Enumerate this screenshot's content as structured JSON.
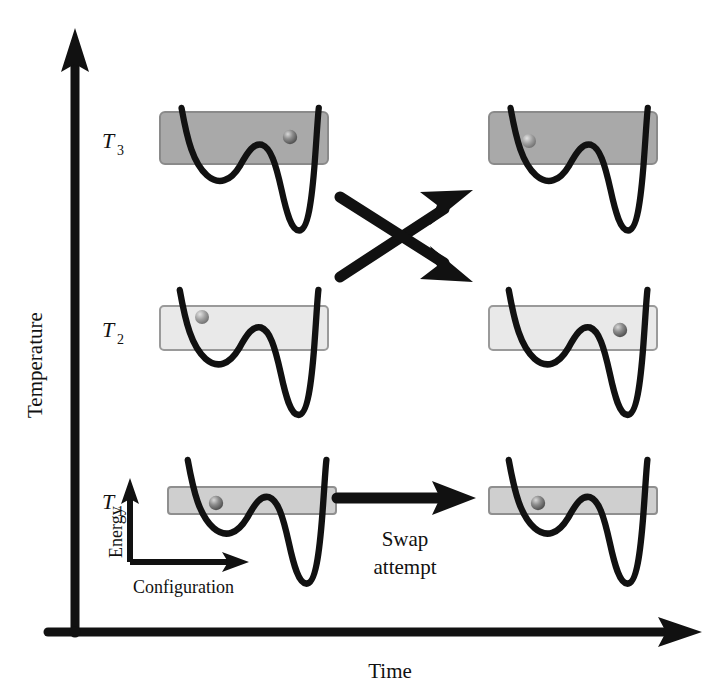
{
  "figure": {
    "background_color": "#ffffff",
    "ink_color": "#111111",
    "width": 715,
    "height": 692
  },
  "axes": {
    "y_axis": {
      "label": "Temperature",
      "name": "temperature-axis",
      "orientation": "vertical",
      "arrow_head": "up",
      "x": 75,
      "y_top": 34,
      "y_bottom": 632
    },
    "x_axis": {
      "label": "Time",
      "name": "time-axis",
      "orientation": "horizontal",
      "arrow_head": "right",
      "y": 632,
      "x_left": 48,
      "x_right": 700
    },
    "origin": {
      "x": 75,
      "y": 632
    }
  },
  "temperature_ticks": [
    {
      "symbol": "T",
      "subscript": "3",
      "label": "T3",
      "y": 141,
      "band_fill": "#a9a9a9",
      "band_stroke": "#8a8a8a",
      "band_height": 52
    },
    {
      "symbol": "T",
      "subscript": "2",
      "label": "T2",
      "y": 330,
      "band_fill": "#e9e9e9",
      "band_stroke": "#9a9a9a",
      "band_height": 44
    },
    {
      "symbol": "T",
      "subscript": "1",
      "label": "T1",
      "y": 502,
      "band_fill": "#cfcfcf",
      "band_stroke": "#8f8f8f",
      "band_height": 27
    }
  ],
  "inset_axes": {
    "x_label": "Configuration",
    "y_label": "Energy",
    "origin": {
      "x": 130,
      "y": 562
    },
    "y_top": 480,
    "x_right": 248
  },
  "panels": [
    {
      "name": "panel-t3-before",
      "temperature": "T3",
      "column": "before",
      "band": {
        "x": 160,
        "y": 112,
        "width": 168,
        "height": 52,
        "fill": "#a9a9a9",
        "stroke": "#8a8a8a"
      },
      "ball": {
        "x": 290,
        "y": 137,
        "state": "right-well",
        "fill": "#6e6e6e"
      },
      "landscape": "double-well"
    },
    {
      "name": "panel-t3-after",
      "temperature": "T3",
      "column": "after",
      "band": {
        "x": 489,
        "y": 112,
        "width": 168,
        "height": 52,
        "fill": "#a9a9a9",
        "stroke": "#8a8a8a"
      },
      "ball": {
        "x": 529,
        "y": 141,
        "state": "left-well",
        "fill": "#8e8e8e"
      },
      "landscape": "double-well"
    },
    {
      "name": "panel-t2-before",
      "temperature": "T2",
      "column": "before",
      "band": {
        "x": 160,
        "y": 306,
        "width": 168,
        "height": 44,
        "fill": "#e9e9e9",
        "stroke": "#9a9a9a"
      },
      "ball": {
        "x": 202,
        "y": 317,
        "state": "left-well",
        "fill": "#8e8e8e"
      },
      "landscape": "double-well"
    },
    {
      "name": "panel-t2-after",
      "temperature": "T2",
      "column": "after",
      "band": {
        "x": 489,
        "y": 306,
        "width": 168,
        "height": 44,
        "fill": "#e9e9e9",
        "stroke": "#9a9a9a"
      },
      "ball": {
        "x": 620,
        "y": 330,
        "state": "right-well",
        "fill": "#6e6e6e"
      },
      "landscape": "double-well"
    },
    {
      "name": "panel-t1-before",
      "temperature": "T1",
      "column": "before",
      "band": {
        "x": 168,
        "y": 487,
        "width": 168,
        "height": 27,
        "fill": "#cfcfcf",
        "stroke": "#8f8f8f"
      },
      "ball": {
        "x": 216,
        "y": 503,
        "state": "left-well",
        "fill": "#6e6e6e"
      },
      "landscape": "double-well"
    },
    {
      "name": "panel-t1-after",
      "temperature": "T1",
      "column": "after",
      "band": {
        "x": 489,
        "y": 487,
        "width": 168,
        "height": 27,
        "fill": "#cfcfcf",
        "stroke": "#8f8f8f"
      },
      "ball": {
        "x": 538,
        "y": 503,
        "state": "left-well",
        "fill": "#6e6e6e"
      },
      "landscape": "double-well"
    }
  ],
  "arrows": {
    "swap_cross": {
      "name": "swap-cross-arrows",
      "description": "Two crossing arrows indicating an accepted replica exchange between T2 and T3",
      "up_arrow": {
        "from_x": 338,
        "from_y": 275,
        "to_x": 468,
        "to_y": 190
      },
      "down_arrow": {
        "from_x": 338,
        "from_y": 196,
        "to_x": 468,
        "to_y": 278
      }
    },
    "swap_attempt": {
      "name": "swap-attempt-arrow",
      "label_line1": "Swap",
      "label_line2": "attempt",
      "from_x": 336,
      "to_x": 474,
      "y": 498,
      "label_x": 405,
      "label_y1": 540,
      "label_y2": 568
    }
  }
}
